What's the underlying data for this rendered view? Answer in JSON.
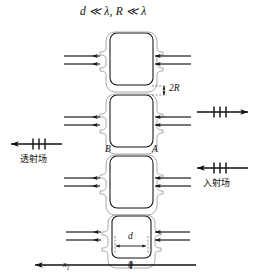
{
  "figure": {
    "title": "d ≪ λ,   R ≪ λ",
    "name": "metamaterial-array-schematic",
    "background_color": "#ffffff",
    "line_color": "#111111",
    "cell_count": 4
  },
  "labels": {
    "radius_dimension": "2R",
    "gap_dimension": "d",
    "node_left": "B",
    "node_right": "A",
    "transmitted_field": "透射场",
    "incident_field": "入射场",
    "axis_name": "x",
    "axis_subscript": "1",
    "axis_origin": "0"
  },
  "arrows": {
    "transmitted_direction": "left",
    "reflected_direction": "right",
    "incident_direction": "left",
    "cell_feed_direction": "left",
    "axis_direction": "left",
    "field_tick_count": 3
  },
  "cells": [
    {
      "index": 1,
      "label": "unit-cell-1"
    },
    {
      "index": 2,
      "label": "unit-cell-2"
    },
    {
      "index": 3,
      "label": "unit-cell-3"
    },
    {
      "index": 4,
      "label": "unit-cell-4"
    }
  ]
}
